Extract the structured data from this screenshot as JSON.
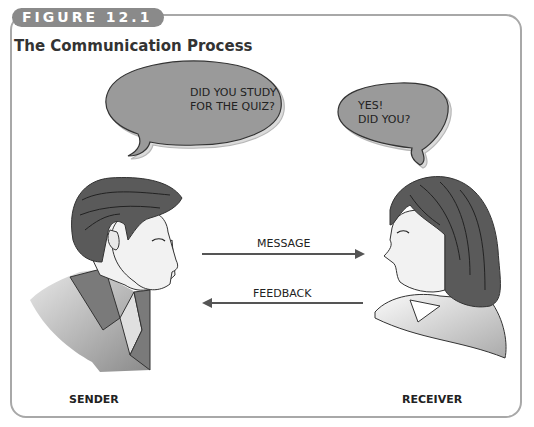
{
  "figure": {
    "tab_label": "FIGURE 12.1",
    "title": "The Communication Process"
  },
  "sender": {
    "label": "SENDER",
    "speech": [
      "DID YOU STUDY",
      "FOR THE QUIZ?"
    ]
  },
  "receiver": {
    "label": "RECEIVER",
    "speech": [
      "YES!",
      "DID YOU?"
    ]
  },
  "arrows": {
    "message": "MESSAGE",
    "feedback": "FEEDBACK"
  },
  "colors": {
    "frame": "#a8a8a8",
    "tab": "#8a8a8a",
    "bubble": "#9a9a9a",
    "hair": "#5a5a5a",
    "arrow": "#555555"
  }
}
